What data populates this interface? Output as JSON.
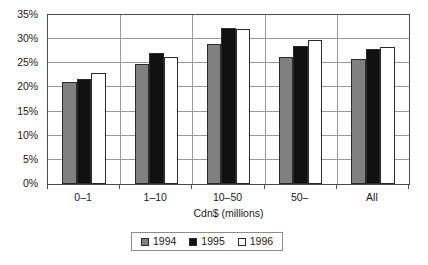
{
  "chart_data": {
    "type": "bar",
    "title": "",
    "subtitle": "",
    "xlabel": "Cdn$ (millions)",
    "ylabel": "",
    "categories": [
      "0–1",
      "1–10",
      "10–50",
      "50–",
      "All"
    ],
    "series": [
      {
        "name": "1994",
        "color": "#808080",
        "values": [
          21.1,
          24.9,
          29.0,
          26.4,
          25.8
        ]
      },
      {
        "name": "1995",
        "color": "#111111",
        "values": [
          21.7,
          27.1,
          32.4,
          28.5,
          27.9
        ]
      },
      {
        "name": "1996",
        "color": "#ffffff",
        "values": [
          23.0,
          26.4,
          32.2,
          29.8,
          28.4
        ]
      }
    ],
    "ylim": [
      0,
      35
    ],
    "ytick_values": [
      0,
      5,
      10,
      15,
      20,
      25,
      30,
      35
    ],
    "ytick_labels": [
      "0%",
      "5%",
      "10%",
      "15%",
      "20%",
      "25%",
      "30%",
      "35%"
    ],
    "grid": "horizontal-and-category-separators",
    "legend_position": "bottom-center",
    "legend_entries": [
      "1994",
      "1995",
      "1996"
    ],
    "value_format": "percent",
    "plot_border_color": "#4d4d4d",
    "gridline_color": "#9a9a9a",
    "background_color": "#ffffff"
  }
}
